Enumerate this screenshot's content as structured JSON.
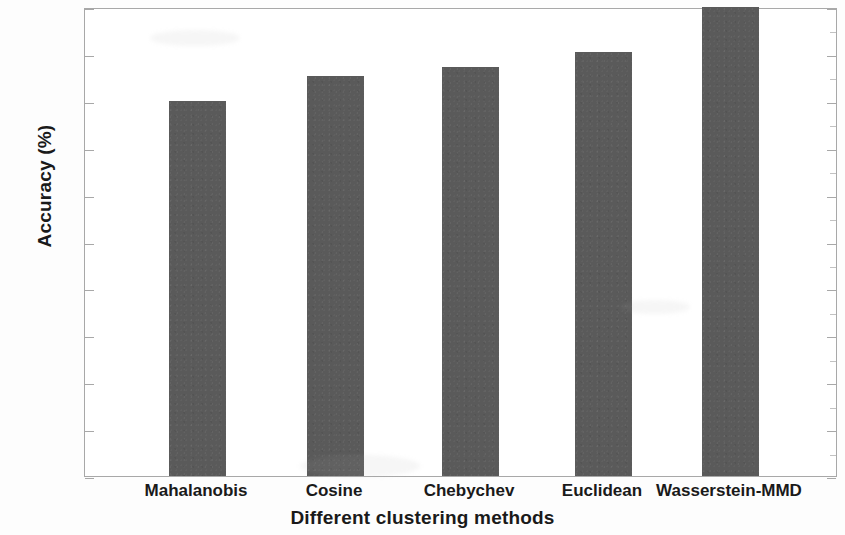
{
  "chart_data": {
    "type": "bar",
    "title": "",
    "xlabel": "Different clustering methods",
    "ylabel": "Accuracy (%)",
    "categories": [
      "Mahalanobis",
      "Cosine",
      "Chebychev",
      "Euclidean",
      "Wasserstein-MMD"
    ],
    "values": [
      80,
      85.3,
      87.2,
      90.4,
      100
    ],
    "ylim": [
      0,
      100
    ],
    "ytick_labels": [
      "0",
      "10",
      "20",
      "30",
      "40",
      "50",
      "60",
      "70",
      "80",
      "90",
      "100"
    ],
    "ytick_values": [
      0,
      10,
      20,
      30,
      40,
      50,
      60,
      70,
      80,
      90,
      100
    ],
    "grid": false,
    "legend": false,
    "bar_color": "#5a5a5a",
    "axis_color": "#a8a8a8",
    "text_color": "#1a1a1a"
  }
}
